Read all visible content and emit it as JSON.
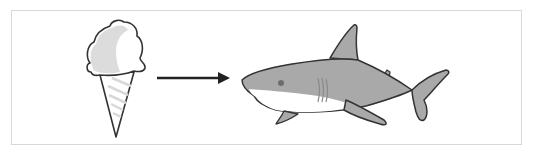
{
  "diagram": {
    "type": "transformation",
    "nodes": [
      {
        "id": "ice-cream",
        "label": "ice cream cone",
        "icon": "ice-cream-icon"
      },
      {
        "id": "shark",
        "label": "shark",
        "icon": "shark-icon"
      }
    ],
    "edges": [
      {
        "from": "ice-cream",
        "to": "shark",
        "style": "solid-arrow"
      }
    ],
    "colors": {
      "outline": "#333333",
      "shark_body": "#a9a9a9",
      "shark_belly": "#ffffff",
      "scoop_shade": "#d6d6d6",
      "arrow": "#222222",
      "frame_border": "#d8d8d8"
    }
  }
}
